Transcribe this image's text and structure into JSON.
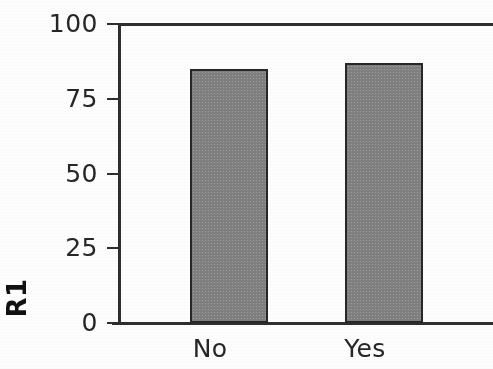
{
  "chart_data": {
    "type": "bar",
    "title": "",
    "subtitle": "",
    "xlabel": "",
    "ylabel": "R1",
    "categories": [
      "No",
      "Yes"
    ],
    "values": [
      85,
      87
    ],
    "ylim": [
      0,
      100
    ],
    "yticks": [
      0,
      25,
      50,
      75,
      100
    ],
    "ytick_labels": [
      "0",
      "25",
      "50",
      "75",
      "100"
    ],
    "grid": false,
    "legend": null,
    "legend_position": "none",
    "bar_fill_color": "#808080",
    "bar_edge_color": "#272727",
    "axis_color": "#2e2e2e",
    "background_color": "#ffffff",
    "annotations": []
  },
  "axis": {
    "y_title": "R1",
    "ticks": [
      {
        "label": "100",
        "value": 100
      },
      {
        "label": "75",
        "value": 75
      },
      {
        "label": "50",
        "value": 50
      },
      {
        "label": "25",
        "value": 25
      },
      {
        "label": "0",
        "value": 0
      }
    ]
  },
  "bars": [
    {
      "category": "No",
      "value": 85
    },
    {
      "category": "Yes",
      "value": 87
    }
  ]
}
